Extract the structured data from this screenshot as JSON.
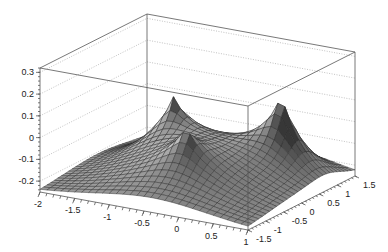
{
  "chart_data": {
    "type": "surface3d",
    "title": "",
    "xlabel": "",
    "ylabel": "",
    "zlabel": "",
    "xlim": [
      -2,
      1
    ],
    "ylim": [
      -1.5,
      1.5
    ],
    "zlim": [
      -0.25,
      0.32
    ],
    "x_ticks": [
      "-2",
      "-1.5",
      "-1",
      "-0.5",
      "0",
      "0.5",
      "1"
    ],
    "x_tick_values": [
      -2,
      -1.5,
      -1,
      -0.5,
      0,
      0.5,
      1
    ],
    "y_ticks": [
      "-1.5",
      "-1",
      "-0.5",
      "0",
      "0.5",
      "1",
      "1.5"
    ],
    "y_tick_values": [
      -1.5,
      -1,
      -0.5,
      0,
      0.5,
      1,
      1.5
    ],
    "z_ticks": [
      "-0.2",
      "-0.1",
      "0",
      "0.1",
      "0.2",
      "0.3"
    ],
    "z_tick_values": [
      -0.2,
      -0.1,
      0,
      0.1,
      0.2,
      0.3
    ],
    "grid": true,
    "peaks": [
      {
        "x": -1.0,
        "y": 0.3,
        "z": 0.22
      },
      {
        "x": -0.35,
        "y": -0.6,
        "z": 0.17
      },
      {
        "x": 0.35,
        "y": 0.7,
        "z": 0.32
      }
    ],
    "colors": {
      "surface": "#9a9a9a",
      "mesh": "#2b2b2b",
      "frame": "#555555",
      "grid": "#999999"
    }
  }
}
